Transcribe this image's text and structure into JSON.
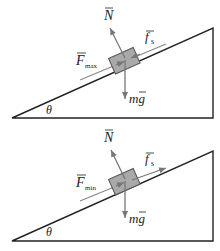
{
  "diagrams": [
    {
      "id": "top",
      "angle_label": "θ",
      "normal_label": "N",
      "friction_label": "f",
      "friction_sub": "s",
      "applied_label": "F",
      "applied_sub": "max",
      "weight_label": "mg",
      "friction_direction": "down-slope"
    },
    {
      "id": "bottom",
      "angle_label": "θ",
      "normal_label": "N",
      "friction_label": "f",
      "friction_sub": "s",
      "applied_label": "F",
      "applied_sub": "min",
      "weight_label": "mg",
      "friction_direction": "up-slope"
    }
  ],
  "colors": {
    "incline": "#222222",
    "block_fill": "#a9a9a9",
    "block_stroke": "#555555",
    "arrow": "#777777"
  }
}
